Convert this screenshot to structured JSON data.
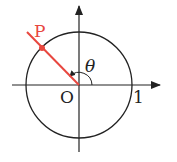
{
  "diagram": {
    "type": "unit-circle",
    "labels": {
      "point": "P",
      "origin": "O",
      "unit": "1",
      "angle": "θ"
    },
    "colors": {
      "ray": "#e8473f",
      "point": "#e8473f",
      "point_label": "#e8473f",
      "axes": "#222222",
      "circle": "#222222"
    },
    "angle_degrees": 135
  }
}
